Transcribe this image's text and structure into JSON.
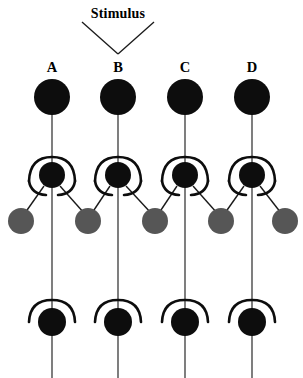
{
  "figure": {
    "title_text": "Stimulus",
    "width": 303,
    "height": 378,
    "background_color": "#ffffff",
    "column_labels": [
      "A",
      "B",
      "C",
      "D"
    ],
    "colors": {
      "soma_black": "#0d0d0d",
      "interneuron_gray": "#565656",
      "axon_line": "#3a3a3a",
      "arc_stroke": "#0d0d0d",
      "background": "#ffffff",
      "text": "#000000"
    },
    "stimulus": {
      "label": "Stimulus",
      "label_x": 118,
      "label_y": 14,
      "arrow_left_start_x": 82,
      "arrow_left_start_y": 21,
      "arrow_apex_x": 118,
      "arrow_apex_y": 53,
      "arrow_right_end_x": 154,
      "arrow_right_end_y": 21,
      "target_column": "B"
    },
    "columns": [
      {
        "label": "A",
        "x": 52,
        "label_y": 71
      },
      {
        "label": "B",
        "x": 118,
        "label_y": 71
      },
      {
        "label": "C",
        "x": 185,
        "label_y": 71
      },
      {
        "label": "D",
        "x": 252,
        "label_y": 71
      }
    ],
    "rows": {
      "input_row": {
        "name": "input-neuron-row",
        "center_y": 97,
        "radius": 18,
        "fill": "#0d0d0d",
        "count": 4
      },
      "relay_row": {
        "name": "relay-neuron-row",
        "center_y": 175,
        "radius": 13,
        "fill": "#0d0d0d",
        "count": 4,
        "has_upper_arc": true,
        "has_lower_left_arc": true,
        "has_lower_right_arc": true
      },
      "interneuron_row": {
        "name": "interneuron-row",
        "center_y": 221,
        "radius": 13,
        "fill": "#565656",
        "count": 5,
        "x_positions": [
          21,
          88,
          155,
          221,
          285
        ]
      },
      "output_row": {
        "name": "output-neuron-row",
        "center_y": 322,
        "radius": 13,
        "fill": "#0d0d0d",
        "count": 4,
        "has_upper_arc": true
      }
    },
    "connections": {
      "input_to_relay": "vertical axon from input soma down to relay soma",
      "relay_to_output": "vertical axon from relay soma down to output soma",
      "output_tail": "vertical axon from output soma to bottom edge",
      "relay_to_interneuron_left": "diagonal branch to gray interneuron on the lower left",
      "relay_to_interneuron_right": "diagonal branch to gray interneuron on the lower right"
    }
  }
}
